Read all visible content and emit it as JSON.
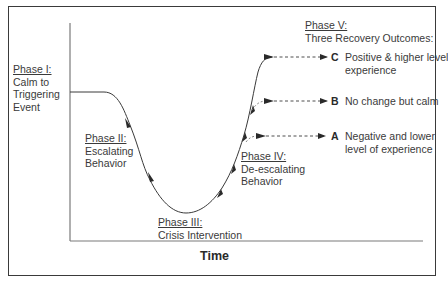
{
  "diagram": {
    "x_axis_label": "Time",
    "phases": [
      {
        "id": "phase1",
        "title": "Phase I:",
        "lines": [
          "Calm to",
          "Triggering",
          "Event"
        ]
      },
      {
        "id": "phase2",
        "title": "Phase II:",
        "lines": [
          "Escalating",
          "Behavior"
        ]
      },
      {
        "id": "phase3",
        "title": "Phase III:",
        "lines": [
          "Crisis Intervention"
        ]
      },
      {
        "id": "phase4",
        "title": "Phase IV:",
        "lines": [
          "De-escalating",
          "Behavior"
        ]
      },
      {
        "id": "phase5",
        "title": "Phase V:",
        "lines": [
          "Three Recovery Outcomes:"
        ]
      }
    ],
    "outcomes": [
      {
        "letter": "C",
        "lines": [
          "Positive & higher level",
          "experience"
        ]
      },
      {
        "letter": "B",
        "lines": [
          "No change but calm"
        ]
      },
      {
        "letter": "A",
        "lines": [
          "Negative and lower",
          "level of experience"
        ]
      }
    ],
    "colors": {
      "line": "#3a3a3a",
      "text": "#3a3a3a",
      "background": "#ffffff"
    }
  }
}
